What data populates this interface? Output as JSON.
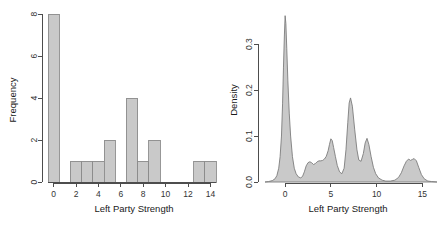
{
  "figure": {
    "title": "",
    "background": "#ffffff",
    "fill_color": "#c9c9c9",
    "line_color": "#7d7d7d",
    "axis_color": "#4d4d4d"
  },
  "chart_data": [
    {
      "type": "bar",
      "title": "",
      "subtitle": "",
      "xlabel": "Left Party Strength",
      "ylabel": "Frequency",
      "xlim": [
        -0.5,
        14.5
      ],
      "ylim": [
        0,
        8
      ],
      "grid": false,
      "legend": "none",
      "xticks": [
        0,
        2,
        4,
        6,
        8,
        10,
        12,
        14
      ],
      "xticklabels": [
        "0",
        "2",
        "4",
        "6",
        "8",
        "10",
        "12",
        "14"
      ],
      "yticks": [
        0,
        2,
        4,
        6,
        8
      ],
      "yticklabels": [
        "0",
        "2",
        "4",
        "6",
        "8"
      ],
      "bin_width": 1,
      "categories": [
        "0",
        "1",
        "2",
        "3",
        "4",
        "5",
        "6",
        "7",
        "8",
        "9",
        "10",
        "11",
        "12",
        "13",
        "14"
      ],
      "bin_starts": [
        -0.5,
        0.5,
        1.5,
        2.5,
        3.5,
        4.5,
        5.5,
        6.5,
        7.5,
        8.5,
        9.5,
        10.5,
        11.5,
        12.5,
        13.5
      ],
      "values": [
        8,
        0,
        1,
        1,
        1,
        2,
        0,
        4,
        1,
        2,
        0,
        0,
        0,
        1,
        1
      ]
    },
    {
      "type": "area",
      "title": "",
      "subtitle": "",
      "xlabel": "Left Party Strength",
      "ylabel": "Density",
      "xlim": [
        -2.2,
        16.6
      ],
      "ylim": [
        0,
        0.37
      ],
      "grid": false,
      "legend": "none",
      "xticks": [
        0,
        5,
        10,
        15
      ],
      "xticklabels": [
        "0",
        "5",
        "10",
        "15"
      ],
      "yticks": [
        0.0,
        0.1,
        0.2,
        0.3
      ],
      "yticklabels": [
        "0.0",
        "0.1",
        "0.2",
        "0.3"
      ],
      "series": [
        {
          "name": "Density",
          "x": [
            -2.2,
            -1.8,
            -1.4,
            -1.1,
            -0.9,
            -0.7,
            -0.55,
            -0.4,
            -0.28,
            -0.18,
            -0.08,
            0.0,
            0.08,
            0.18,
            0.3,
            0.45,
            0.6,
            0.8,
            1.0,
            1.2,
            1.45,
            1.7,
            1.9,
            2.1,
            2.3,
            2.5,
            2.7,
            2.9,
            3.1,
            3.3,
            3.5,
            3.7,
            3.9,
            4.1,
            4.3,
            4.5,
            4.7,
            4.85,
            5.0,
            5.15,
            5.3,
            5.5,
            5.7,
            5.95,
            6.2,
            6.45,
            6.65,
            6.85,
            7.0,
            7.15,
            7.35,
            7.6,
            7.85,
            8.05,
            8.3,
            8.55,
            8.75,
            8.95,
            9.15,
            9.4,
            9.65,
            9.9,
            10.2,
            10.6,
            11.0,
            11.5,
            12.0,
            12.4,
            12.7,
            13.0,
            13.25,
            13.5,
            13.7,
            13.9,
            14.1,
            14.35,
            14.6,
            14.9,
            15.2,
            15.6,
            16.0,
            16.6
          ],
          "y": [
            0.0,
            0.001,
            0.003,
            0.007,
            0.014,
            0.03,
            0.055,
            0.1,
            0.17,
            0.25,
            0.32,
            0.362,
            0.345,
            0.29,
            0.22,
            0.15,
            0.1,
            0.055,
            0.03,
            0.018,
            0.011,
            0.009,
            0.012,
            0.022,
            0.035,
            0.042,
            0.044,
            0.042,
            0.038,
            0.04,
            0.044,
            0.046,
            0.046,
            0.047,
            0.05,
            0.056,
            0.068,
            0.082,
            0.094,
            0.09,
            0.075,
            0.055,
            0.036,
            0.022,
            0.018,
            0.03,
            0.07,
            0.13,
            0.172,
            0.183,
            0.165,
            0.115,
            0.07,
            0.048,
            0.045,
            0.062,
            0.085,
            0.095,
            0.082,
            0.055,
            0.032,
            0.018,
            0.009,
            0.004,
            0.002,
            0.002,
            0.004,
            0.01,
            0.02,
            0.035,
            0.045,
            0.05,
            0.047,
            0.049,
            0.051,
            0.046,
            0.032,
            0.016,
            0.007,
            0.002,
            0.001,
            0.0
          ]
        }
      ]
    }
  ]
}
